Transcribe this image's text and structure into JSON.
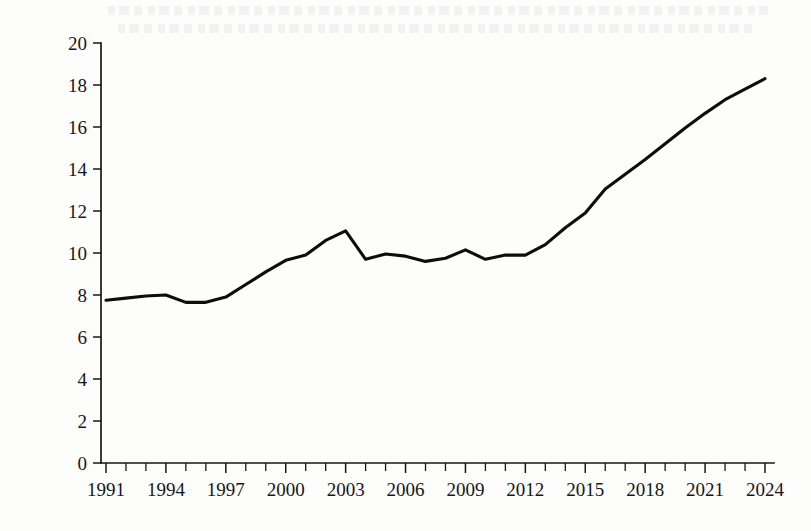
{
  "page": {
    "background_color": "#fdfdfc",
    "ink_color": "#0d0d0d"
  },
  "y_axis": {
    "title": "占GDP比重(%)"
  },
  "chart_data": {
    "type": "line",
    "title": "",
    "subtitle": "",
    "xlabel": "",
    "ylabel": "占GDP比重(%)",
    "xlim": [
      1991,
      2024
    ],
    "ylim": [
      0,
      20
    ],
    "grid": false,
    "legend": null,
    "legend_position": "none",
    "y_ticks": [
      0,
      2,
      4,
      6,
      8,
      10,
      12,
      14,
      16,
      18,
      20
    ],
    "y_tick_labels": [
      "0",
      "2",
      "4",
      "6",
      "8",
      "10",
      "12",
      "14",
      "16",
      "18",
      "20"
    ],
    "x_ticks": [
      1991,
      1994,
      1997,
      2000,
      2003,
      2006,
      2009,
      2012,
      2015,
      2018,
      2021,
      2024
    ],
    "x_tick_labels": [
      "1991",
      "1994",
      "1997",
      "2000",
      "2003",
      "2006",
      "2009",
      "2012",
      "2015",
      "2018",
      "2021",
      "2024"
    ],
    "x_minor_tick_interval": 1,
    "series": [
      {
        "name": "占GDP比重(%)",
        "color": "#0d0d0d",
        "x": [
          1991,
          1992,
          1993,
          1994,
          1995,
          1996,
          1997,
          1998,
          1999,
          2000,
          2001,
          2002,
          2003,
          2004,
          2005,
          2006,
          2007,
          2008,
          2009,
          2010,
          2011,
          2012,
          2013,
          2014,
          2015,
          2016,
          2017,
          2018,
          2019,
          2020,
          2021,
          2022,
          2023,
          2024
        ],
        "values": [
          7.75,
          7.85,
          7.95,
          8.0,
          7.65,
          7.65,
          7.9,
          8.5,
          9.1,
          9.65,
          9.9,
          10.6,
          11.05,
          9.7,
          9.95,
          9.85,
          9.6,
          9.75,
          10.15,
          9.7,
          9.9,
          9.9,
          10.4,
          11.2,
          11.9,
          13.05,
          13.75,
          14.45,
          15.2,
          15.95,
          16.65,
          17.3,
          17.8,
          18.3
        ]
      }
    ]
  }
}
